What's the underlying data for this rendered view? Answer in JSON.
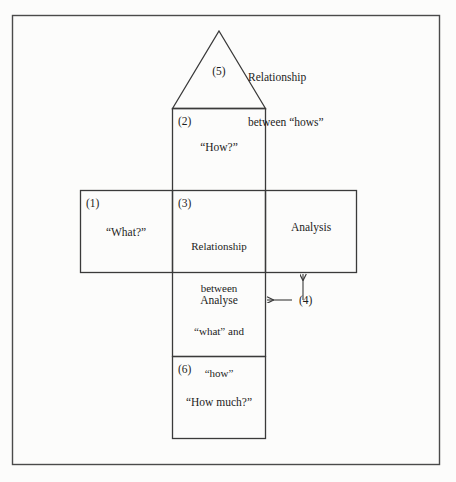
{
  "diagram": {
    "background_color": "#fcfcfb",
    "line_color": "#3a3a3a",
    "text_color": "#1c1c1c",
    "outer_frame": {
      "x": 12,
      "y": 15,
      "width": 428,
      "height": 450
    },
    "markers": {
      "one": "(1)",
      "two": "(2)",
      "three": "(3)",
      "four": "(4)",
      "five": "(5)",
      "six": "(6)"
    },
    "rooms": {
      "roof": {
        "marker": "(5)",
        "note_line_1": "Relationship",
        "note_line_2": "between “hows”"
      },
      "hows": {
        "marker": "(2)",
        "label": "“How?”"
      },
      "whats": {
        "marker": "(1)",
        "label": "“What?”"
      },
      "relationship": {
        "marker": "(3)",
        "line_1": "Relationship",
        "line_2": "between",
        "line_3": "“what” and",
        "line_4": "“how”"
      },
      "analysis": {
        "label": "Analysis"
      },
      "analyse": {
        "label": "Analyse",
        "marker": "(4)"
      },
      "how_much": {
        "marker": "(6)",
        "label": "“How much?”"
      }
    },
    "arrows": [
      {
        "name": "arrow-to-analyse",
        "direction": "left",
        "label": "(4)"
      },
      {
        "name": "arrow-to-analysis",
        "direction": "up",
        "label": "(4)"
      }
    ]
  }
}
